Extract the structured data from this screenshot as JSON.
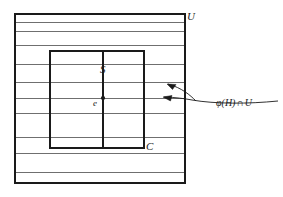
{
  "figure": {
    "colors": {
      "stroke": "#1a1a1a",
      "stroke_light": "#6f6f6f",
      "background": "#ffffff"
    },
    "outer_region": {
      "label": "U",
      "name": "open-set-U",
      "x": 15,
      "y": 14,
      "width": 170,
      "height": 169
    },
    "inner_region": {
      "label": "C",
      "name": "compact-set-C",
      "x": 50,
      "y": 51,
      "width": 94,
      "height": 97
    },
    "divider": {
      "label": "S",
      "name": "sheet-divider-S",
      "x": 103,
      "y_top": 51,
      "y_bottom": 148
    },
    "point": {
      "label": "e",
      "name": "identity-point-e",
      "x": 103,
      "y": 98
    },
    "sheets": {
      "name": "horizontal-sheet-lines",
      "count": 10,
      "y_positions": [
        22,
        31,
        45,
        64,
        82,
        98,
        113,
        137,
        153,
        172
      ]
    },
    "annotation": {
      "name": "phi-H-intersect-U-label",
      "symbol": "φ",
      "argument": "(H)",
      "operator": "∩",
      "target": "U",
      "text": "φ(H) ∩ U",
      "leader": {
        "start_x": 278,
        "start_y": 101,
        "arrow_upper": {
          "x": 167,
          "y": 84
        },
        "arrow_lower": {
          "x": 163,
          "y": 97
        }
      }
    }
  }
}
